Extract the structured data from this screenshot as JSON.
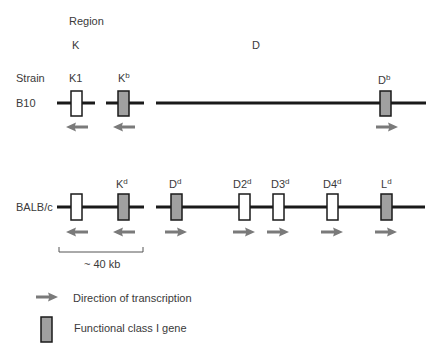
{
  "header": {
    "region_label": "Region",
    "region_k": "K",
    "region_d": "D",
    "strain_label": "Strain"
  },
  "strains": [
    {
      "name": "B10",
      "genes": [
        {
          "base": "K1",
          "sup": "",
          "functional": false,
          "direction": "left"
        },
        {
          "base": "K",
          "sup": "b",
          "functional": true,
          "direction": "left"
        },
        {
          "base": "D",
          "sup": "b",
          "functional": true,
          "direction": "right"
        }
      ]
    },
    {
      "name": "BALB/c",
      "genes": [
        {
          "base": "",
          "sup": "",
          "functional": false,
          "direction": "left"
        },
        {
          "base": "K",
          "sup": "d",
          "functional": true,
          "direction": "left"
        },
        {
          "base": "D",
          "sup": "d",
          "functional": true,
          "direction": "right"
        },
        {
          "base": "D2",
          "sup": "d",
          "functional": false,
          "direction": "right"
        },
        {
          "base": "D3",
          "sup": "d",
          "functional": false,
          "direction": "right"
        },
        {
          "base": "D4",
          "sup": "d",
          "functional": false,
          "direction": "right"
        },
        {
          "base": "L",
          "sup": "d",
          "functional": true,
          "direction": "right"
        }
      ]
    }
  ],
  "scale_bar": {
    "label": "~ 40 kb"
  },
  "legend": [
    {
      "icon": "arrow-right-icon",
      "label": "Direction of transcription"
    },
    {
      "icon": "functional-gene-box-icon",
      "label": "Functional class I gene"
    }
  ],
  "colors": {
    "line": "#1a1a1a",
    "functional_fill": "#a0a0a0",
    "nonfunctional_fill": "#ffffff",
    "arrow": "#7a7a7a",
    "text": "#3a3a3a"
  }
}
